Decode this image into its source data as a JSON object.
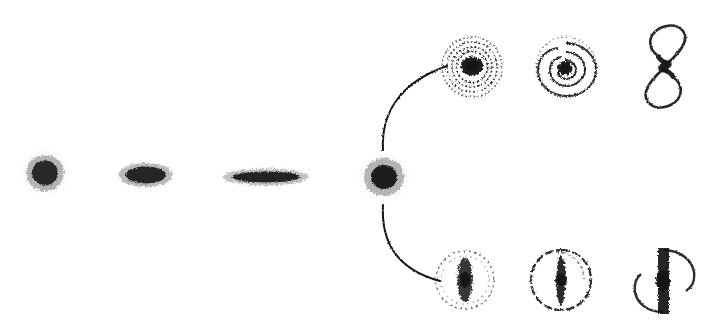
{
  "figure": {
    "kind": "diagram",
    "background_color": "#ffffff",
    "ink_color": "#121212",
    "width": 710,
    "height": 335,
    "style": "hand-drawn stippled ink, scanned halftone, no text labels visible"
  },
  "sequences": {
    "elliptical_branch": {
      "name": "elliptical sequence",
      "connector_style": "dashed",
      "nodes": [
        {
          "id": "E0",
          "shape": "round-fuzzy-blob",
          "cx": 45,
          "cy": 173,
          "rx": 26,
          "ry": 25,
          "angle": 0,
          "density": "medium",
          "core": "diffuse"
        },
        {
          "id": "E3",
          "shape": "flattened-ellipse-blob",
          "cx": 146,
          "cy": 175,
          "rx": 31,
          "ry": 16,
          "angle": 0,
          "density": "medium-high",
          "core": "diffuse"
        },
        {
          "id": "E7",
          "shape": "highly-flattened-ellipse-blob",
          "cx": 266,
          "cy": 177,
          "rx": 46,
          "ry": 11,
          "angle": 0,
          "density": "high",
          "core": "elongated"
        },
        {
          "id": "S0",
          "shape": "round-blob-dense-core",
          "cx": 384,
          "cy": 177,
          "rx": 27,
          "ry": 26,
          "angle": 0,
          "density": "high",
          "core": "compact-dark"
        }
      ],
      "connectors": [
        {
          "from": "E0",
          "to": "E3",
          "x1": 74,
          "x2": 114,
          "y": 176,
          "dashes": 3
        },
        {
          "from": "E3",
          "to": "E7",
          "x1": 180,
          "x2": 218,
          "y": 177,
          "dashes": 3
        },
        {
          "from": "E7",
          "to": "S0",
          "x1": 315,
          "x2": 356,
          "y": 178,
          "dashes": 3
        }
      ]
    },
    "upper_branch": {
      "name": "normal spiral sequence",
      "connector_style": "solid",
      "fork_curve": {
        "from_x": 384,
        "from_y": 150,
        "to_x": 446,
        "to_y": 66
      },
      "nodes": [
        {
          "id": "Sa",
          "shape": "tight-spiral",
          "cx": 472,
          "cy": 67,
          "r": 31,
          "bulge": "large",
          "arms": "tightly-wound",
          "turns": 2.6
        },
        {
          "id": "Sb",
          "shape": "intermediate-spiral",
          "cx": 566,
          "cy": 67,
          "r": 31,
          "bulge": "medium",
          "arms": "moderately-wound",
          "turns": 1.9
        },
        {
          "id": "Sc",
          "shape": "open-spiral",
          "cx": 666,
          "cy": 66,
          "r": 33,
          "bulge": "small",
          "arms": "wide-open-two-arm",
          "turns": 0.9
        }
      ],
      "connectors": [
        {
          "from": "Sa",
          "to": "Sb",
          "x1": 504,
          "x2": 534,
          "y": 67
        },
        {
          "from": "Sb",
          "to": "Sc",
          "x1": 598,
          "x2": 640,
          "y": 67
        }
      ]
    },
    "lower_branch": {
      "name": "barred spiral sequence",
      "connector_style": "solid",
      "fork_curve": {
        "from_x": 384,
        "from_y": 205,
        "to_x": 438,
        "to_y": 281
      },
      "nodes": [
        {
          "id": "SBa",
          "shape": "barred-tight",
          "cx": 465,
          "cy": 280,
          "r": 30,
          "bar_length": 52,
          "bar_width": 15,
          "ring": "faint-dashed",
          "arms": "tightly-wound"
        },
        {
          "id": "SBb",
          "shape": "barred-intermediate",
          "cx": 561,
          "cy": 280,
          "r": 31,
          "bar_length": 56,
          "bar_width": 10,
          "ring": "distinct",
          "arms": "moderately-wound"
        },
        {
          "id": "SBc",
          "shape": "barred-open",
          "cx": 663,
          "cy": 281,
          "r": 33,
          "bar_length": 62,
          "bar_width": 8,
          "ring": "open-broken",
          "arms": "wide-open-two-arm"
        }
      ],
      "connectors": [
        {
          "from": "SBa",
          "to": "SBb",
          "x1": 498,
          "x2": 528,
          "y": 281
        },
        {
          "from": "SBb",
          "to": "SBc",
          "x1": 595,
          "x2": 635,
          "y": 281
        }
      ]
    }
  },
  "labels": []
}
